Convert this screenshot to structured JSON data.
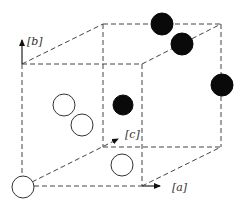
{
  "diagram": {
    "type": "unit-cell",
    "axes": {
      "a": {
        "label": "[a]"
      },
      "b": {
        "label": "[b]"
      },
      "c": {
        "label": "[c]"
      }
    },
    "colors": {
      "filled_atom": "#0a0a0a",
      "open_atom": "#ffffff",
      "edges": "#444444"
    },
    "atoms": {
      "filled": [
        {
          "x": 162,
          "y": 24
        },
        {
          "x": 182,
          "y": 44
        },
        {
          "x": 222,
          "y": 85
        },
        {
          "x": 123,
          "y": 105
        }
      ],
      "open": [
        {
          "x": 64,
          "y": 105
        },
        {
          "x": 82,
          "y": 125
        },
        {
          "x": 122,
          "y": 165
        },
        {
          "x": 23,
          "y": 187
        }
      ]
    }
  }
}
